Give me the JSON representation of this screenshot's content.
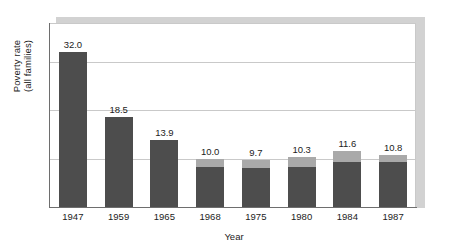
{
  "chart_data": {
    "type": "bar",
    "title": "",
    "xlabel": "Year",
    "ylabel_line1": "Poverty rate",
    "ylabel_line2": "(all families)",
    "categories": [
      "1947",
      "1959",
      "1965",
      "1968",
      "1975",
      "1980",
      "1984",
      "1987"
    ],
    "values": [
      32.0,
      18.5,
      13.9,
      10.0,
      9.7,
      10.3,
      11.6,
      10.8
    ],
    "data_labels": [
      "32.0",
      "18.5",
      "13.9",
      "10.0",
      "9.7",
      "10.3",
      "11.6",
      "10.8"
    ],
    "highlight_cap_values": [
      null,
      null,
      null,
      1.8,
      1.7,
      2.0,
      2.3,
      1.6
    ],
    "ylim": [
      0,
      32
    ],
    "grid": true,
    "gridline_values": [
      10,
      20,
      30
    ],
    "legend": "none",
    "series": [
      {
        "name": "Poverty rate (all families)",
        "values": [
          32.0,
          18.5,
          13.9,
          10.0,
          9.7,
          10.3,
          11.6,
          10.8
        ]
      }
    ]
  },
  "colors": {
    "bar": "#4d4d4d",
    "bar_cap": "#a9a9a9",
    "gridline": "#c9c9c9",
    "axis": "#6e6e6e",
    "shadow": "#d2d2d2",
    "text": "#1c1c1c",
    "background": "#ffffff"
  }
}
